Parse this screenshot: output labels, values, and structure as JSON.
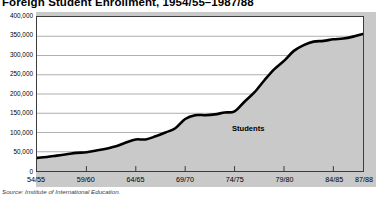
{
  "chart_data": {
    "type": "area",
    "title": "Foreign Student Enrollment, 1954/55–1987/88",
    "xlabel": "",
    "ylabel": "",
    "ylim": [
      0,
      400000
    ],
    "grid": true,
    "legend_position": "inline",
    "series_annotation": "Students",
    "source": "Source: Institute of International Education.",
    "ytick_labels": [
      "400,000",
      "350,000",
      "300,000",
      "250,000",
      "200,000",
      "150,000",
      "100,000",
      "50,000",
      "0"
    ],
    "ytick_values": [
      400000,
      350000,
      300000,
      250000,
      200000,
      150000,
      100000,
      50000,
      0
    ],
    "xtick_labels": [
      "54/55",
      "59/60",
      "64/65",
      "69/70",
      "74/75",
      "79/80",
      "84/85",
      "87/88"
    ],
    "categories": [
      "54/55",
      "55/56",
      "56/57",
      "57/58",
      "58/59",
      "59/60",
      "60/61",
      "61/62",
      "62/63",
      "63/64",
      "64/65",
      "65/66",
      "66/67",
      "67/68",
      "68/69",
      "69/70",
      "70/71",
      "71/72",
      "72/73",
      "73/74",
      "74/75",
      "75/76",
      "76/77",
      "77/78",
      "78/79",
      "79/80",
      "80/81",
      "81/82",
      "82/83",
      "83/84",
      "84/85",
      "85/86",
      "86/87",
      "87/88"
    ],
    "series": [
      {
        "name": "Students",
        "values": [
          34000,
          36500,
          40000,
          43500,
          47000,
          48500,
          53000,
          58000,
          64000,
          74000,
          82000,
          82000,
          90000,
          100000,
          111000,
          135000,
          145000,
          145000,
          147000,
          152000,
          155000,
          180000,
          204000,
          235000,
          264000,
          286000,
          312000,
          327000,
          336000,
          338000,
          342000,
          344000,
          349000,
          356000
        ],
        "line_color": "#000000",
        "fill_color": "#c9c9c9"
      }
    ]
  },
  "axes": {
    "y_max": 400000,
    "y_min": 0,
    "x_first": "54/55",
    "x_last": "87/88"
  },
  "colors": {
    "plot_background": "#ffffff",
    "page_background": "#ffffff",
    "band_background": "#c9c9c9",
    "gridline": "#9a9a9a",
    "frame": "#3c3c3c",
    "line": "#000000",
    "text": "#000000"
  }
}
